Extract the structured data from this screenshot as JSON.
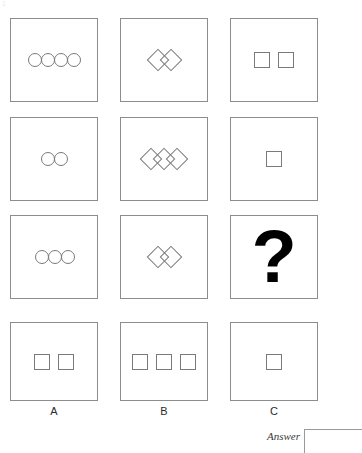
{
  "page": {
    "corner_mark": "1",
    "background_color": "#ffffff",
    "outline_color": "#8d8d8d",
    "shape_outline_color": "#7a7a7a",
    "question_mark_color": "#000000"
  },
  "matrix": {
    "rows": [
      {
        "row_index": 1,
        "cells": [
          {
            "id": "r1c1",
            "shape": "circle",
            "count": 4,
            "arrangement": "touching-row",
            "label": "four circles"
          },
          {
            "id": "r1c2",
            "shape": "diamond",
            "count": 2,
            "arrangement": "overlapping-row",
            "label": "two diamonds"
          },
          {
            "id": "r1c3",
            "shape": "square",
            "count": 2,
            "arrangement": "spaced-row",
            "label": "two squares"
          }
        ]
      },
      {
        "row_index": 2,
        "cells": [
          {
            "id": "r2c1",
            "shape": "circle",
            "count": 2,
            "arrangement": "touching-row",
            "label": "two circles"
          },
          {
            "id": "r2c2",
            "shape": "diamond",
            "count": 3,
            "arrangement": "overlapping-row",
            "label": "three diamonds"
          },
          {
            "id": "r2c3",
            "shape": "square",
            "count": 1,
            "arrangement": "spaced-row",
            "label": "one square"
          }
        ]
      },
      {
        "row_index": 3,
        "cells": [
          {
            "id": "r3c1",
            "shape": "circle",
            "count": 3,
            "arrangement": "touching-row",
            "label": "three circles"
          },
          {
            "id": "r3c2",
            "shape": "diamond",
            "count": 2,
            "arrangement": "overlapping-row",
            "label": "two diamonds"
          },
          {
            "id": "r3c3",
            "shape": "question",
            "count": 0,
            "arrangement": "none",
            "label": "?",
            "glyph": "?"
          }
        ]
      }
    ]
  },
  "options": {
    "items": [
      {
        "key": "A",
        "shape": "square",
        "count": 2,
        "label": "A"
      },
      {
        "key": "B",
        "shape": "square",
        "count": 3,
        "label": "B"
      },
      {
        "key": "C",
        "shape": "square",
        "count": 1,
        "label": "C"
      }
    ]
  },
  "answer": {
    "label": "Answer",
    "value": "",
    "placeholder": ""
  }
}
